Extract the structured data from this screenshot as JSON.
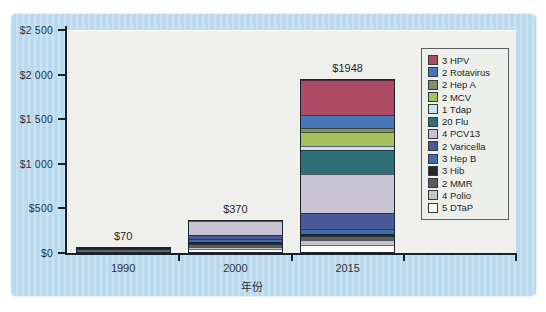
{
  "chart_data": {
    "type": "stacked-bar",
    "title": "",
    "xlabel": "年份",
    "categories": [
      "1990",
      "2000",
      "2015"
    ],
    "totals": [
      "$70",
      "$370",
      "$1948"
    ],
    "ylim": [
      0,
      2500
    ],
    "grid": "off",
    "legend_position": "upper-right",
    "y_ticks": [
      {
        "label": "$0",
        "value": 0
      },
      {
        "label": "$500",
        "value": 500
      },
      {
        "label": "$1 000",
        "value": 1000
      },
      {
        "label": "$1 500",
        "value": 1500
      },
      {
        "label": "$2 000",
        "value": 2000
      },
      {
        "label": "$2 500",
        "value": 2500
      }
    ],
    "series": [
      {
        "name": "3 HPV",
        "color": "#ad4a66",
        "values": [
          0,
          0,
          390
        ]
      },
      {
        "name": "2 Rotavirus",
        "color": "#4677b8",
        "values": [
          0,
          0,
          150
        ]
      },
      {
        "name": "2 Hep A",
        "color": "#7e8f6e",
        "values": [
          0,
          0,
          46
        ]
      },
      {
        "name": "2 MCV",
        "color": "#a6c05c",
        "values": [
          0,
          0,
          160
        ]
      },
      {
        "name": "1 Tdap",
        "color": "#cfdfe9",
        "values": [
          0,
          0,
          42
        ]
      },
      {
        "name": "20 Flu",
        "color": "#2e7077",
        "values": [
          0,
          0,
          280
        ]
      },
      {
        "name": "4 PCV13",
        "color": "#c7c3d3",
        "values": [
          0,
          170,
          436
        ]
      },
      {
        "name": "2 Varicella",
        "color": "#4a5a99",
        "values": [
          0,
          45,
          184
        ]
      },
      {
        "name": "3 Hep B",
        "color": "#3d6dae",
        "values": [
          0,
          35,
          50
        ]
      },
      {
        "name": "3 Hib",
        "color": "#26282c",
        "values": [
          20,
          25,
          30
        ]
      },
      {
        "name": "2 MMR",
        "color": "#595b5e",
        "values": [
          30,
          35,
          40
        ]
      },
      {
        "name": "4 Polio",
        "color": "#c3c5c2",
        "values": [
          10,
          25,
          60
        ]
      },
      {
        "name": "5 DTaP",
        "color": "#fafaf7",
        "values": [
          10,
          35,
          80
        ]
      }
    ]
  },
  "colors": {
    "panel_background": "#b9d9ee",
    "plot_background": "#eff0ec",
    "axis": "#17222c",
    "text": "#2c3237"
  }
}
